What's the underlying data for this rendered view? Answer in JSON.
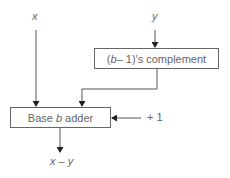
{
  "inputs": {
    "x_label": "x",
    "y_label": "y",
    "plus_one_label": "+ 1"
  },
  "complement_box": {
    "prefix": "(",
    "var": "b",
    "suffix": " – 1)'s complement"
  },
  "adder_box": {
    "prefix": "Base ",
    "var": "b",
    "suffix": " adder"
  },
  "output": {
    "label": "x – y"
  },
  "colors": {
    "line": "#333333",
    "box_border": "#666666",
    "text": "#666666"
  }
}
